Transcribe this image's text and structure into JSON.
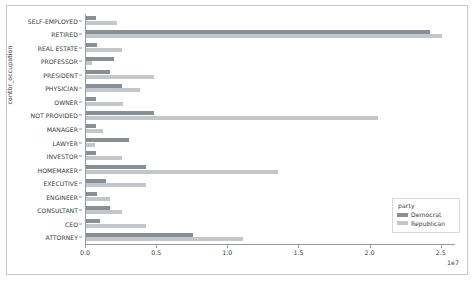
{
  "chart_data": {
    "type": "bar",
    "orientation": "horizontal",
    "title": "",
    "xlabel": "",
    "ylabel": "contbr_occupation",
    "x_offset_text": "1e7",
    "xlim": [
      0,
      2.6
    ],
    "xticks": [
      "0.0",
      "0.5",
      "1.0",
      "1.5",
      "2.0",
      "2.5"
    ],
    "xtick_values": [
      0.0,
      0.5,
      1.0,
      1.5,
      2.0,
      2.5
    ],
    "grid": false,
    "legend": {
      "title": "party",
      "position": "lower-right",
      "entries": [
        {
          "name": "Democrat",
          "color": "#8a8f96"
        },
        {
          "name": "Republican",
          "color": "#c3c6ca"
        }
      ]
    },
    "categories": [
      "SELF-EMPLOYED",
      "RETIRED",
      "REAL ESTATE",
      "PROFESSOR",
      "PRESIDENT",
      "PHYSICIAN",
      "OWNER",
      "NOT PROVIDED",
      "MANAGER",
      "LAWYER",
      "INVESTOR",
      "HOMEMAKER",
      "EXECUTIVE",
      "ENGINEER",
      "CONSULTANT",
      "CEO",
      "ATTORNEY"
    ],
    "series": [
      {
        "name": "Democrat",
        "color": "#8a8f96",
        "values": [
          0.07,
          2.42,
          0.08,
          0.2,
          0.17,
          0.25,
          0.07,
          0.48,
          0.07,
          0.3,
          0.07,
          0.42,
          0.14,
          0.08,
          0.17,
          0.1,
          0.75
        ]
      },
      {
        "name": "Republican",
        "color": "#c3c6ca",
        "values": [
          0.22,
          2.5,
          0.25,
          0.04,
          0.48,
          0.38,
          0.26,
          2.05,
          0.12,
          0.06,
          0.25,
          1.35,
          0.42,
          0.17,
          0.25,
          0.42,
          1.1
        ]
      }
    ]
  }
}
